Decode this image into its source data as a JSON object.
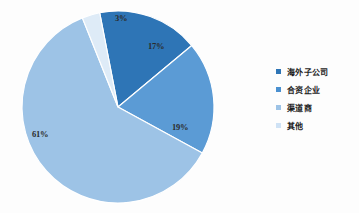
{
  "background_color": "#fdfdfd",
  "chart_data": {
    "type": "pie",
    "title": "",
    "subtitle": "",
    "xlabel": "",
    "ylabel": "",
    "grid": false,
    "legend_position": "right",
    "categories": [
      "海外子公司",
      "合资企业",
      "渠道商",
      "其他"
    ],
    "values": [
      17,
      19,
      61,
      3
    ],
    "value_labels": [
      "17%",
      "19%",
      "61%",
      "3%"
    ],
    "colors": [
      "#2e75b6",
      "#5b9bd5",
      "#9dc3e6",
      "#deebf7"
    ],
    "slices": [
      {
        "name": "海外子公司",
        "value": 17,
        "label": "17%",
        "color": "#2e75b6",
        "label_x": 148,
        "label_y": 41
      },
      {
        "name": "合资企业",
        "value": 19,
        "label": "19%",
        "color": "#5b9bd5",
        "label_x": 172,
        "label_y": 122
      },
      {
        "name": "渠道商",
        "value": 61,
        "label": "61%",
        "color": "#9dc3e6",
        "label_x": 32,
        "label_y": 129
      },
      {
        "name": "其他",
        "value": 3,
        "label": "3%",
        "color": "#deebf7",
        "label_x": 115,
        "label_y": 13
      }
    ],
    "geometry": {
      "center_x": 118,
      "center_y": 107,
      "radius": 96,
      "start_angle_deg": -11,
      "separator_color": "#ffffff",
      "separator_width": 1.2
    }
  },
  "legend": {
    "items": [
      {
        "label": "海外子公司",
        "color": "#2e75b6",
        "marker": "square-marker"
      },
      {
        "label": "合资企业",
        "color": "#4a90d0"
      },
      {
        "label": "渠道商",
        "color": "#9dc3e6"
      },
      {
        "label": "其他",
        "color": "#cfe2f5"
      }
    ]
  }
}
